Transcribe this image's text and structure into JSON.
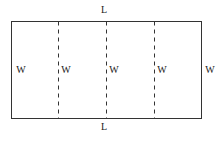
{
  "figure": {
    "type": "geometry-diagram",
    "background_color": "#ffffff",
    "stroke_color": "#333333",
    "dash_color": "#333333",
    "text_color": "#1a1a1a",
    "canvas": {
      "width": 224,
      "height": 142
    },
    "rectangle": {
      "x": 11,
      "y": 21,
      "width": 191,
      "height": 98,
      "stroke_width": 1
    },
    "dashed_lines": [
      {
        "name": "divider-1",
        "x": 58,
        "y1": 21,
        "y2": 119
      },
      {
        "name": "divider-2",
        "x": 106,
        "y1": 21,
        "y2": 119
      },
      {
        "name": "divider-3",
        "x": 154,
        "y1": 21,
        "y2": 119
      }
    ],
    "dash_pattern": "4,4"
  },
  "labels": {
    "length_top": {
      "text": "L",
      "x": 103,
      "y": 6
    },
    "length_bottom": {
      "text": "L",
      "x": 103,
      "y": 123
    },
    "widths": [
      {
        "text": "W",
        "x": 17,
        "y": 65
      },
      {
        "text": "W",
        "x": 61,
        "y": 65
      },
      {
        "text": "W",
        "x": 109,
        "y": 65
      },
      {
        "text": "W",
        "x": 157,
        "y": 65
      },
      {
        "text": "W",
        "x": 205,
        "y": 65
      }
    ]
  }
}
